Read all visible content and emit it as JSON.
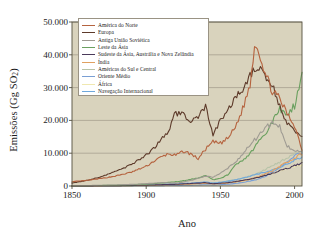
{
  "chart_data": {
    "type": "line",
    "title": "",
    "xlabel": "Ano",
    "ylabel": "Emissões (Gg SO₂)",
    "xlim": [
      1850,
      2005
    ],
    "ylim": [
      0,
      50000
    ],
    "xticks": [
      "1850",
      "1900",
      "1950",
      "2000"
    ],
    "xtick_values": [
      1850,
      1900,
      1950,
      2000
    ],
    "yticks": [
      "0",
      "10.000",
      "20.000",
      "30.000",
      "40.000",
      "50.000"
    ],
    "ytick_values": [
      0,
      10000,
      20000,
      30000,
      40000,
      50000
    ],
    "grid": "horizontal",
    "legend_position": "upper-left-inside",
    "plot_background": "#d9d3bd",
    "x": [
      1850,
      1860,
      1870,
      1880,
      1890,
      1900,
      1905,
      1910,
      1915,
      1920,
      1925,
      1930,
      1935,
      1940,
      1945,
      1950,
      1955,
      1960,
      1965,
      1970,
      1973,
      1975,
      1980,
      1985,
      1990,
      1995,
      2000,
      2005
    ],
    "series": [
      {
        "name": "América do Norte",
        "color": "#b5633f",
        "values": [
          1300,
          1700,
          2300,
          3100,
          4200,
          6000,
          7500,
          8800,
          9800,
          9300,
          10600,
          9800,
          8300,
          11200,
          13400,
          13000,
          14500,
          17800,
          23500,
          30800,
          42800,
          42500,
          34500,
          29000,
          26500,
          22000,
          18500,
          11200
        ]
      },
      {
        "name": "Europa",
        "color": "#5d3a2a",
        "values": [
          900,
          1700,
          2900,
          4500,
          6500,
          9500,
          11500,
          14000,
          17000,
          22500,
          21500,
          19800,
          20500,
          24500,
          15500,
          19800,
          23500,
          26300,
          29800,
          34000,
          35800,
          36000,
          33800,
          30500,
          24500,
          19000,
          16500,
          15300
        ]
      },
      {
        "name": "Antiga União Soviética",
        "color": "#9e9a92",
        "values": [
          100,
          150,
          220,
          320,
          480,
          700,
          850,
          1000,
          1000,
          900,
          1200,
          1700,
          2300,
          3000,
          2600,
          3800,
          5400,
          7200,
          9800,
          12500,
          14000,
          15000,
          17500,
          19200,
          18200,
          12000,
          10800,
          10500
        ]
      },
      {
        "name": "Leste da Ásia",
        "color": "#6aa05f",
        "values": [
          80,
          110,
          170,
          250,
          380,
          560,
          700,
          900,
          1100,
          1300,
          1600,
          2000,
          2500,
          3300,
          1900,
          2300,
          3400,
          6200,
          7800,
          9800,
          11500,
          13200,
          15200,
          19500,
          23500,
          22000,
          24500,
          34000
        ]
      },
      {
        "name": "Sudeste da Ásia, Austrália e Nova Zelândia",
        "color": "#4a3a5a",
        "values": [
          30,
          45,
          70,
          110,
          170,
          250,
          320,
          400,
          470,
          540,
          640,
          760,
          880,
          1000,
          700,
          850,
          1050,
          1350,
          1700,
          2100,
          2400,
          2600,
          3200,
          3900,
          4600,
          5300,
          6300,
          6900
        ]
      },
      {
        "name": "Índia",
        "color": "#e0a060",
        "values": [
          20,
          30,
          50,
          80,
          120,
          190,
          240,
          300,
          360,
          420,
          500,
          600,
          700,
          820,
          600,
          720,
          900,
          1200,
          1600,
          2100,
          2500,
          2800,
          3600,
          4700,
          6000,
          7200,
          8600,
          9800
        ]
      },
      {
        "name": "Américas do Sul e Central",
        "color": "#b8c3a8",
        "values": [
          25,
          40,
          65,
          100,
          150,
          230,
          290,
          360,
          430,
          500,
          600,
          720,
          860,
          1000,
          900,
          1150,
          1500,
          1900,
          2400,
          3100,
          3600,
          3900,
          5000,
          6200,
          7300,
          8500,
          9600,
          10300
        ]
      },
      {
        "name": "Oriente Médio",
        "color": "#7a9fd4",
        "values": [
          10,
          15,
          22,
          33,
          50,
          75,
          95,
          120,
          145,
          175,
          210,
          260,
          320,
          390,
          320,
          420,
          560,
          760,
          1050,
          1500,
          1800,
          2000,
          2900,
          4200,
          5800,
          7400,
          9200,
          10100
        ]
      },
      {
        "name": "África",
        "color": "#f0e8b0",
        "values": [
          15,
          22,
          34,
          52,
          80,
          120,
          150,
          190,
          230,
          280,
          340,
          410,
          500,
          600,
          520,
          660,
          850,
          1100,
          1450,
          1900,
          2200,
          2400,
          3100,
          3900,
          4700,
          5300,
          5900,
          6300
        ]
      },
      {
        "name": "Navegação Internacional",
        "color": "#6fa8dc",
        "values": [
          40,
          60,
          90,
          140,
          210,
          320,
          400,
          490,
          580,
          620,
          760,
          900,
          1060,
          1250,
          900,
          1150,
          1450,
          1850,
          2350,
          3000,
          3400,
          3600,
          4200,
          4900,
          5700,
          6600,
          7800,
          8600
        ]
      }
    ]
  },
  "legend": {
    "entries": [
      {
        "label": "América do Norte"
      },
      {
        "label": "Europa"
      },
      {
        "label": "Antiga União Soviética"
      },
      {
        "label": "Leste da Ásia"
      },
      {
        "label": "Sudeste da Ásia, Austrália e Nova Zelândia"
      },
      {
        "label": "Índia"
      },
      {
        "label": "Américas do Sul e Central"
      },
      {
        "label": "Oriente Médio"
      },
      {
        "label": "África"
      },
      {
        "label": "Navegação Internacional"
      }
    ]
  },
  "axes": {
    "ylabel_main": "Emissões (Gg SO",
    "ylabel_sub": "2",
    "ylabel_end": ")",
    "xlabel": "Ano"
  }
}
